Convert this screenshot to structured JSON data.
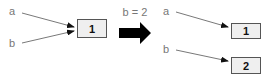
{
  "diagram": {
    "before": {
      "variables": [
        "a",
        "b"
      ],
      "object_value": "1",
      "pointers": [
        {
          "from": "a",
          "to": "1"
        },
        {
          "from": "b",
          "to": "1"
        }
      ]
    },
    "transition_label": "b = 2",
    "after": {
      "variables": [
        "a",
        "b"
      ],
      "objects": [
        "1",
        "2"
      ],
      "pointers": [
        {
          "from": "a",
          "to": "1"
        },
        {
          "from": "b",
          "to": "2"
        }
      ]
    }
  },
  "colors": {
    "box_fill": "#efefef",
    "box_stroke": "#555555",
    "label": "#777777",
    "arrow": "#111111"
  }
}
